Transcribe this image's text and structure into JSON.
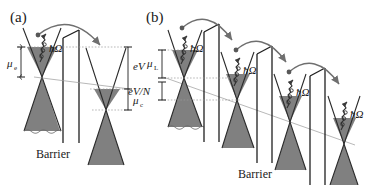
{
  "figure": {
    "type": "band-diagram",
    "colors": {
      "fill_gray": "#808080",
      "line_dark": "#262626",
      "line_gray": "#7a7a7a",
      "background": "#ffffff",
      "text": "#1a1a1a"
    }
  },
  "panels": [
    {
      "id": "a",
      "label": "(a)",
      "barrier_label": "Barrier",
      "barrier_count": 1,
      "cone_count": 2,
      "labels": [
        {
          "name": "mu-e",
          "base": "μ",
          "sub": "e"
        },
        {
          "name": "hbar-omega",
          "text": "ħΩ"
        },
        {
          "name": "eV",
          "text": "eV"
        },
        {
          "name": "mu-c",
          "base": "μ",
          "sub": "c"
        }
      ]
    },
    {
      "id": "b",
      "label": "(b)",
      "barrier_label": "Barrier",
      "barrier_count": 3,
      "cone_count": 4,
      "labels": [
        {
          "name": "mu-L",
          "base": "μ",
          "sub": "L"
        },
        {
          "name": "eV-over-N",
          "text": "eV/N"
        },
        {
          "name": "hbar-omega-1",
          "text": "ħΩ"
        },
        {
          "name": "hbar-omega-2",
          "text": "ħΩ"
        },
        {
          "name": "hbar-omega-3",
          "text": "ħΩ"
        },
        {
          "name": "hbar-omega-4",
          "text": "ħΩ"
        }
      ]
    }
  ],
  "text": {
    "panel_a_label": "(a)",
    "panel_b_label": "(b)",
    "barrier_a": "Barrier",
    "barrier_b": "Barrier",
    "mu_e_base": "μ",
    "mu_e_sub": "e",
    "mu_c_base": "μ",
    "mu_c_sub": "c",
    "mu_L_base": "μ",
    "mu_L_sub": "L",
    "eV": "eV",
    "eV_over_N": "eV/N",
    "hbar_omega_a": "ħΩ",
    "hbar_omega_b1": "ħΩ",
    "hbar_omega_b2": "ħΩ",
    "hbar_omega_b3": "ħΩ",
    "hbar_omega_b4": "ħΩ"
  }
}
